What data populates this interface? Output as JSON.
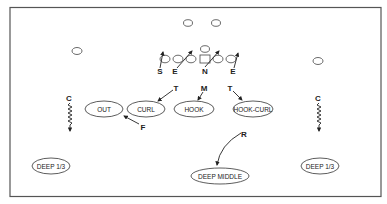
{
  "diagram": {
    "title": "",
    "colors": {
      "stroke": "#333333",
      "text": "#222222",
      "background": "#ffffff",
      "frame": "#555555"
    },
    "offense": {
      "players": [
        {
          "id": "wr-left",
          "shape": "oval",
          "x": 77,
          "y": 51
        },
        {
          "id": "back-left",
          "shape": "oval",
          "x": 188,
          "y": 23
        },
        {
          "id": "back-right",
          "shape": "oval",
          "x": 216,
          "y": 23
        },
        {
          "id": "qb",
          "shape": "oval",
          "x": 205,
          "y": 49
        },
        {
          "id": "te",
          "shape": "oval",
          "x": 165,
          "y": 59
        },
        {
          "id": "lt",
          "shape": "oval",
          "x": 178,
          "y": 59
        },
        {
          "id": "lg",
          "shape": "oval",
          "x": 191,
          "y": 59
        },
        {
          "id": "center",
          "shape": "square",
          "x": 205,
          "y": 59
        },
        {
          "id": "rg",
          "shape": "oval",
          "x": 218,
          "y": 59
        },
        {
          "id": "rt",
          "shape": "oval",
          "x": 231,
          "y": 59
        },
        {
          "id": "wr-right",
          "shape": "oval",
          "x": 318,
          "y": 61
        }
      ]
    },
    "defense": {
      "players": [
        {
          "label": "S",
          "x": 160,
          "y": 73
        },
        {
          "label": "E",
          "x": 175,
          "y": 73
        },
        {
          "label": "N",
          "x": 205,
          "y": 73
        },
        {
          "label": "E",
          "x": 233,
          "y": 73
        },
        {
          "label": "T",
          "x": 176,
          "y": 90
        },
        {
          "label": "M",
          "x": 204,
          "y": 90
        },
        {
          "label": "T",
          "x": 230,
          "y": 90
        },
        {
          "label": "C",
          "x": 69,
          "y": 98
        },
        {
          "label": "C",
          "x": 318,
          "y": 98
        },
        {
          "label": "F",
          "x": 142,
          "y": 127
        },
        {
          "label": "R",
          "x": 244,
          "y": 136
        }
      ]
    },
    "zones": [
      {
        "label": "OUT",
        "x": 104,
        "y": 109,
        "rx": 19,
        "ry": 8
      },
      {
        "label": "CURL",
        "x": 146,
        "y": 109,
        "rx": 19,
        "ry": 8
      },
      {
        "label": "HOOK",
        "x": 194,
        "y": 109,
        "rx": 20,
        "ry": 8
      },
      {
        "label": "HOOK-CURL",
        "x": 253,
        "y": 109,
        "rx": 20,
        "ry": 8
      },
      {
        "label": "DEEP 1/3",
        "x": 51,
        "y": 166,
        "rx": 19,
        "ry": 8
      },
      {
        "label": "DEEP MIDDLE",
        "x": 220,
        "y": 176,
        "rx": 29,
        "ry": 8
      },
      {
        "label": "DEEP 1/3",
        "x": 320,
        "y": 166,
        "rx": 19,
        "ry": 8
      }
    ]
  }
}
